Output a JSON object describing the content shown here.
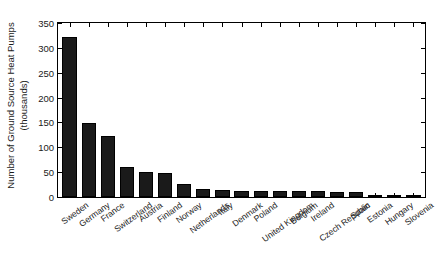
{
  "chart_data": {
    "type": "bar",
    "title": "",
    "subtitle": "",
    "xlabel": "",
    "ylabel": "Number of Ground Source Heat Pumps (thousands)",
    "ylabel_line1": "Number of Ground Source Heat Pumps",
    "ylabel_line2": "(thousands)",
    "ylim": [
      0,
      350
    ],
    "yticks": [
      0,
      50,
      100,
      150,
      200,
      250,
      300,
      350
    ],
    "ytick_labels": [
      "0",
      "50",
      "100",
      "150",
      "200",
      "250",
      "300",
      "350"
    ],
    "grid": false,
    "legend": null,
    "legend_position": "none",
    "bar_color": "#1a1a1a",
    "axis_color": "#000000",
    "background_color": "#ffffff",
    "categories": [
      "Sweden",
      "Germany",
      "France",
      "Switzerland",
      "Austria",
      "Finland",
      "Norway",
      "Netherlands",
      "Italy",
      "Denmark",
      "Poland",
      "United Kingdom",
      "Belgium",
      "Ireland",
      "Czech Republic",
      "Spain",
      "Estonia",
      "Hungary",
      "Slovenia"
    ],
    "values": [
      322,
      149,
      122,
      61,
      50,
      48,
      27,
      16,
      14,
      13,
      13,
      12,
      12,
      12,
      11,
      10,
      5,
      4,
      3
    ]
  }
}
